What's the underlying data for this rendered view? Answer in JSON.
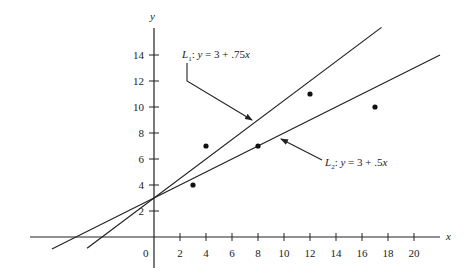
{
  "chart_data": {
    "type": "scatter",
    "title": "",
    "xlabel": "x",
    "ylabel": "y",
    "xlim": [
      -9,
      22
    ],
    "ylim": [
      -2.5,
      16
    ],
    "grid": false,
    "x_ticks": [
      0,
      2,
      4,
      6,
      8,
      10,
      12,
      14,
      16,
      18,
      20
    ],
    "x_tick_labels": [
      "0",
      "2",
      "4",
      "6",
      "8",
      "10",
      "12",
      "14",
      "16",
      "18",
      "20"
    ],
    "y_ticks": [
      2,
      4,
      6,
      8,
      10,
      12,
      14
    ],
    "y_tick_labels": [
      "2",
      "4",
      "6",
      "8",
      "10",
      "12",
      "14"
    ],
    "points": [
      {
        "x": 3,
        "y": 4
      },
      {
        "x": 4,
        "y": 7
      },
      {
        "x": 8,
        "y": 7
      },
      {
        "x": 12,
        "y": 11
      },
      {
        "x": 17,
        "y": 10
      }
    ],
    "series": [
      {
        "name": "L1",
        "type": "line",
        "intercept": 3,
        "slope": 0.75,
        "x_range": [
          -5.15,
          17.5
        ],
        "label": "L1: y = 3 + .75x"
      },
      {
        "name": "L2",
        "type": "line",
        "intercept": 3,
        "slope": 0.5,
        "x_range": [
          -7.85,
          22.0
        ],
        "label": "L2: y = 3 + .5x"
      }
    ],
    "annotations": [
      {
        "text": "L1: y = 3 + .75x",
        "points_to": "L1"
      },
      {
        "text": "L2: y = 3 + .5x",
        "points_to": "L2"
      }
    ]
  },
  "labels": {
    "x_axis": "x",
    "y_axis": "y",
    "origin": "0",
    "l1": {
      "name": "L",
      "sub": "1",
      "eq_pre": ": ",
      "y": "y",
      "eq_mid": " = 3 + .75",
      "x": "x"
    },
    "l2": {
      "name": "L",
      "sub": "2",
      "eq_pre": ": ",
      "y": "y",
      "eq_mid": " = 3 + .5",
      "x": "x"
    }
  },
  "colors": {
    "ink": "#222222",
    "background": "#ffffff"
  }
}
